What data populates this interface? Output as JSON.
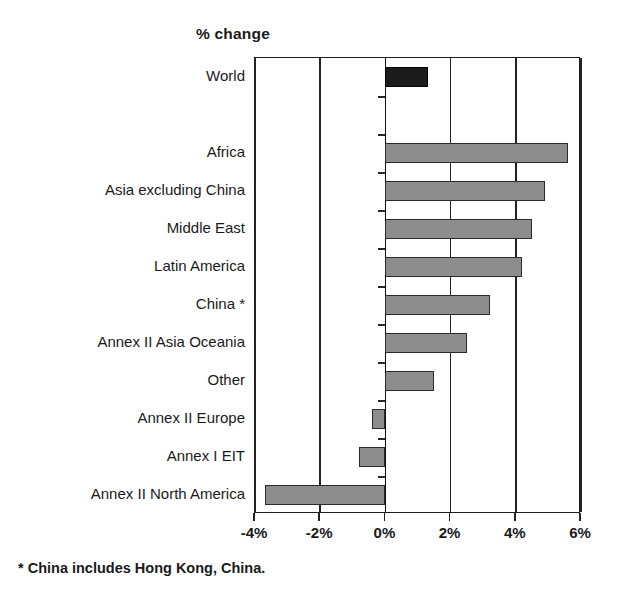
{
  "axis_title": "% change",
  "footnote": "* China includes Hong Kong, China.",
  "x_ticks": [
    {
      "label": "-4%",
      "value": -4
    },
    {
      "label": "-2%",
      "value": -2
    },
    {
      "label": "0%",
      "value": 0
    },
    {
      "label": "2%",
      "value": 2
    },
    {
      "label": "4%",
      "value": 4
    },
    {
      "label": "6%",
      "value": 6
    }
  ],
  "chart_data": {
    "type": "bar",
    "orientation": "horizontal",
    "title": "",
    "xlabel": "% change",
    "ylabel": "",
    "xlim": [
      -4,
      6
    ],
    "grid": true,
    "legend": false,
    "annotations": [
      "* China includes Hong Kong, China."
    ],
    "categories": [
      "World",
      "",
      "Africa",
      "Asia excluding China",
      "Middle East",
      "Latin America",
      "China *",
      "Annex II Asia Oceania",
      "Other",
      "Annex II Europe",
      "Annex I EIT",
      "Annex II North America"
    ],
    "values": [
      1.3,
      null,
      5.6,
      4.9,
      4.5,
      4.2,
      3.2,
      2.5,
      1.5,
      -0.4,
      -0.8,
      -3.7
    ],
    "bar_colors": [
      "#1b1b1b",
      null,
      "#8d8d8d",
      "#8d8d8d",
      "#8d8d8d",
      "#8d8d8d",
      "#8d8d8d",
      "#8d8d8d",
      "#8d8d8d",
      "#8d8d8d",
      "#8d8d8d",
      "#8d8d8d"
    ],
    "tick_labels": [
      "-4%",
      "-2%",
      "0%",
      "2%",
      "4%",
      "6%"
    ]
  }
}
